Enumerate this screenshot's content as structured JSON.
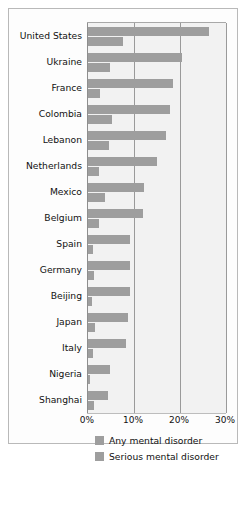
{
  "chart_data": {
    "type": "bar",
    "orientation": "horizontal",
    "title": "",
    "subtitle": "",
    "xlabel": "",
    "ylabel": "",
    "xlim": [
      0,
      30
    ],
    "xticks": [
      "0%",
      "10%",
      "20%",
      "30%"
    ],
    "xtick_values": [
      0,
      10,
      20,
      30
    ],
    "grid": "vertical",
    "legend_position": "below",
    "categories": [
      "United States",
      "Ukraine",
      "France",
      "Colombia",
      "Lebanon",
      "Netherlands",
      "Mexico",
      "Belgium",
      "Spain",
      "Germany",
      "Beijing",
      "Japan",
      "Italy",
      "Nigeria",
      "Shanghai"
    ],
    "series": [
      {
        "name": "Any mental disorder",
        "color": "#9e9e9e",
        "values": [
          26.4,
          20.5,
          18.4,
          17.8,
          16.9,
          14.9,
          12.2,
          12.0,
          9.2,
          9.1,
          9.1,
          8.8,
          8.2,
          4.7,
          4.3
        ]
      },
      {
        "name": "Serious mental disorder",
        "color": "#9e9e9e",
        "values": [
          7.7,
          4.8,
          2.7,
          5.2,
          4.6,
          2.3,
          3.7,
          2.4,
          1.0,
          1.2,
          0.9,
          1.5,
          1.0,
          0.4,
          1.4
        ]
      }
    ]
  },
  "legend": {
    "items": [
      {
        "label": "Any mental disorder"
      },
      {
        "label": "Serious mental disorder"
      }
    ]
  }
}
